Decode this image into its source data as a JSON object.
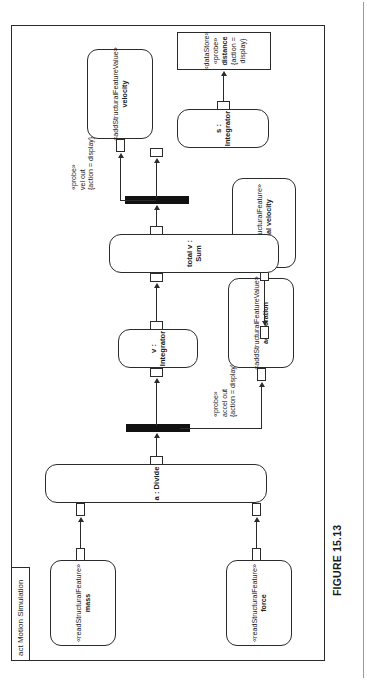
{
  "figure": {
    "caption": "FIGURE 15.13"
  },
  "diagram": {
    "kind": "uml-activity-diagram",
    "frame_label": "act Motion Simulation",
    "nodes": [
      {
        "id": "force",
        "type": "read-structural-feature",
        "stereotype": "«readStructuralFeature»",
        "name": "force"
      },
      {
        "id": "mass",
        "type": "read-structural-feature",
        "stereotype": "«readStructuralFeature»",
        "name": "mass"
      },
      {
        "id": "divide",
        "type": "action",
        "name": "a : Divide"
      },
      {
        "id": "acceleration",
        "type": "add-structural-feature-value",
        "stereotype": "«addStructuralFeatureValue»",
        "name": "acceleration"
      },
      {
        "id": "v-integrator",
        "type": "action",
        "name": "v : Integrator"
      },
      {
        "id": "initial-velocity",
        "type": "read-structural-feature",
        "stereotype": "«readStructuralFeature»",
        "name": "initial velocity"
      },
      {
        "id": "total-v-sum",
        "type": "action",
        "name": "total v : Sum"
      },
      {
        "id": "velocity",
        "type": "add-structural-feature-value",
        "stereotype": "«addStructuralFeatureValue»",
        "name": "velocity"
      },
      {
        "id": "s-integrator",
        "type": "action",
        "name": "s : Integrator"
      },
      {
        "id": "distance",
        "type": "datastore",
        "stereotype": "«dataStore»",
        "stereotype2": "«probe»",
        "name": "distance",
        "constraint": "{action = display}"
      }
    ],
    "edge_labels": [
      {
        "id": "accel-out-probe",
        "line1": "«probe»",
        "line2": "accel out",
        "line3": "{action = display}"
      },
      {
        "id": "vel-out-probe",
        "line1": "«probe»",
        "line2": "vel out",
        "line3": "{action = display}"
      }
    ],
    "forks": [
      {
        "id": "fork-acceleration",
        "type": "fork-node"
      },
      {
        "id": "fork-velocity",
        "type": "fork-node"
      }
    ]
  }
}
